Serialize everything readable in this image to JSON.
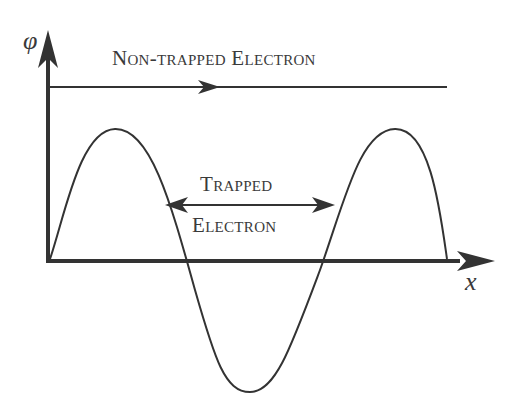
{
  "diagram": {
    "y_axis_label": "φ",
    "x_axis_label": "x",
    "non_trapped_label": "Non-trapped Electron",
    "trapped_label_line1": "Trapped",
    "trapped_label_line2": "Electron"
  },
  "colors": {
    "line": "#333333",
    "text": "#3a3a3a",
    "background": "#ffffff"
  }
}
